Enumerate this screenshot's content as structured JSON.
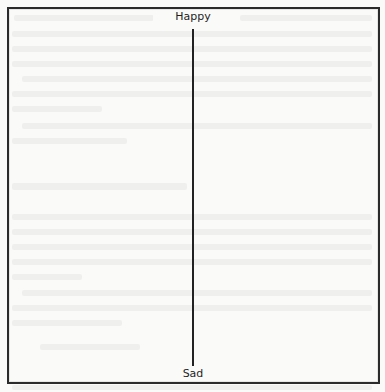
{
  "diagram": {
    "type": "vertical-scale",
    "top_label": "Happy",
    "bottom_label": "Sad",
    "line_color": "#222222",
    "frame_color": "#2b2b2b",
    "background_color": "#fafaf9"
  }
}
